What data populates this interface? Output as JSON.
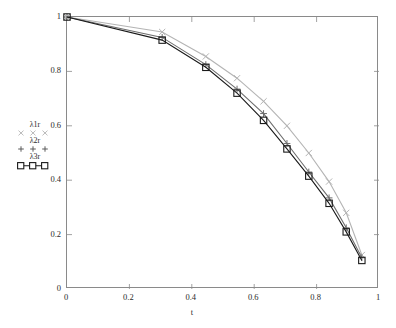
{
  "chart_data": {
    "type": "line",
    "title": "",
    "subtitle": "",
    "xlabel": "t",
    "ylabel": "",
    "xlim": [
      0,
      1
    ],
    "ylim": [
      0,
      1
    ],
    "grid": false,
    "legend_position": "left-outside",
    "xticks": [
      "0",
      "0.2",
      "0.4",
      "0.6",
      "0.8",
      "1"
    ],
    "xtick_values": [
      0,
      0.2,
      0.4,
      0.6,
      0.8,
      1
    ],
    "yticks": [
      "0",
      "0.2",
      "0.4",
      "0.6",
      "0.8",
      "1"
    ],
    "ytick_values": [
      0,
      0.2,
      0.4,
      0.6,
      0.8,
      1
    ],
    "annotations": [],
    "series": [
      {
        "name": "λ1r",
        "marker": "cross-x",
        "color": "#b4b4b4",
        "x": [
          0,
          0.305,
          0.445,
          0.545,
          0.63,
          0.705,
          0.775,
          0.84,
          0.895,
          0.945
        ],
        "values": [
          1.0,
          0.945,
          0.855,
          0.775,
          0.69,
          0.6,
          0.5,
          0.395,
          0.28,
          0.125
        ]
      },
      {
        "name": "λ2r",
        "marker": "plus",
        "color": "#6e6e6e",
        "x": [
          0,
          0.305,
          0.445,
          0.545,
          0.63,
          0.705,
          0.775,
          0.84,
          0.895,
          0.945
        ],
        "values": [
          1.0,
          0.925,
          0.825,
          0.735,
          0.645,
          0.535,
          0.43,
          0.335,
          0.225,
          0.115
        ]
      },
      {
        "name": "λ3r",
        "marker": "square",
        "color": "#1a1a1a",
        "x": [
          0,
          0.305,
          0.445,
          0.545,
          0.63,
          0.705,
          0.775,
          0.84,
          0.895,
          0.945
        ],
        "values": [
          1.0,
          0.915,
          0.815,
          0.72,
          0.62,
          0.515,
          0.415,
          0.315,
          0.21,
          0.105
        ]
      }
    ]
  },
  "legend": {
    "entries": [
      {
        "label": "λ1r",
        "marker": "cross-x"
      },
      {
        "label": "λ2r",
        "marker": "plus"
      },
      {
        "label": "λ3r",
        "marker": "square"
      }
    ]
  },
  "axes": {
    "x_title": "t"
  }
}
